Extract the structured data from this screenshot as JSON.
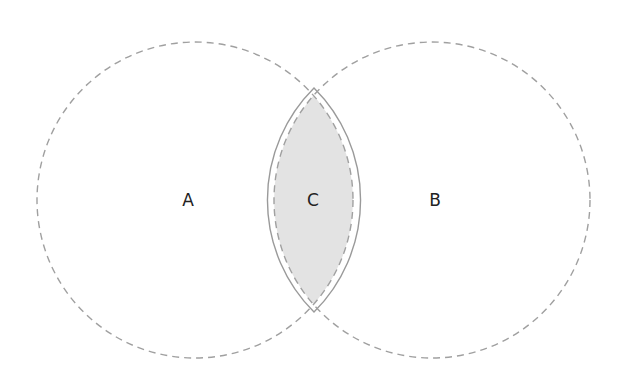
{
  "diagram": {
    "type": "venn",
    "sets": [
      {
        "id": "A",
        "label": "A",
        "cx": 195,
        "cy": 200,
        "r": 158
      },
      {
        "id": "B",
        "label": "B",
        "cx": 432,
        "cy": 200,
        "r": 158
      }
    ],
    "intersection": {
      "id": "C",
      "label": "C",
      "of": [
        "A",
        "B"
      ],
      "highlighted": true
    },
    "colors": {
      "circle_stroke": "#a0a0a0",
      "intersection_fill": "#e3e3e3",
      "intersection_stroke": "#9a9a9a",
      "label": "#222222",
      "background": "#ffffff"
    }
  }
}
